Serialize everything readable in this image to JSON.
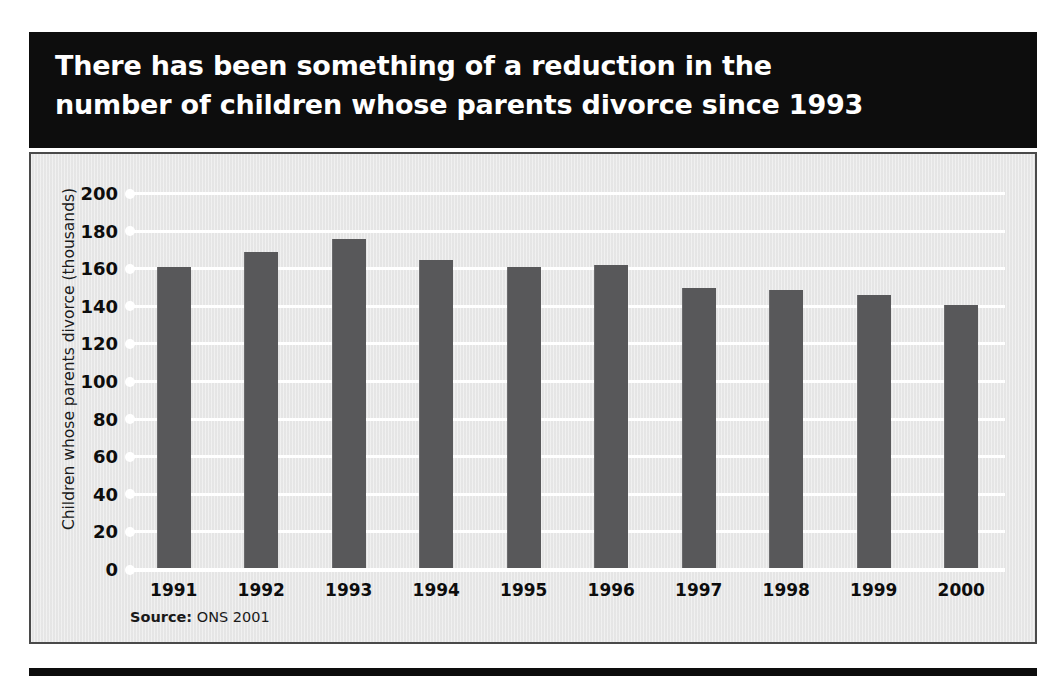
{
  "title": {
    "line1": "There has been something of a reduction in the",
    "line2": "number of children whose parents divorce since 1993"
  },
  "source_note": {
    "label": "Source:",
    "value": "ONS 2001"
  },
  "colors": {
    "banner_background": "#0d0d0d",
    "banner_text": "#ffffff",
    "panel_background": "#e9e9e9",
    "panel_border": "#4a4a4a",
    "bar": "#58585a",
    "gridline": "#ffffff",
    "axis_text": "#0d0d0d"
  },
  "chart_data": {
    "type": "bar",
    "title": "There has been something of a reduction in the number of children whose parents divorce since 1993",
    "xlabel": "",
    "ylabel": "Children whose parents divorce (thousands)",
    "ylim": [
      0,
      200
    ],
    "ytick_step": 20,
    "yticks": [
      200,
      180,
      160,
      140,
      120,
      100,
      80,
      60,
      40,
      20,
      0
    ],
    "grid": true,
    "legend": false,
    "categories": [
      "1991",
      "1992",
      "1993",
      "1994",
      "1995",
      "1996",
      "1997",
      "1998",
      "1999",
      "2000"
    ],
    "values": [
      160,
      168,
      175,
      164,
      160,
      161,
      149,
      148,
      145,
      140
    ],
    "source": "Source: ONS 2001"
  }
}
